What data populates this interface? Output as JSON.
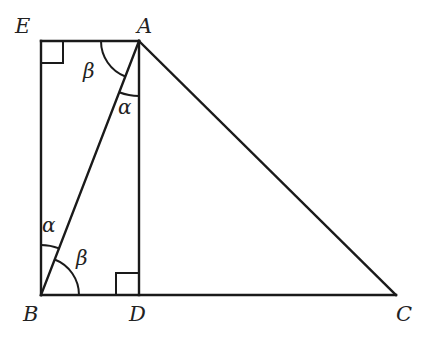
{
  "diagram": {
    "type": "geometry",
    "points": {
      "E": {
        "label": "E",
        "x": 41,
        "y": 41
      },
      "A": {
        "label": "A",
        "x": 139,
        "y": 41
      },
      "B": {
        "label": "B",
        "x": 41,
        "y": 295
      },
      "D": {
        "label": "D",
        "x": 139,
        "y": 295
      },
      "C": {
        "label": "C",
        "x": 396,
        "y": 295
      }
    },
    "segments": [
      [
        "E",
        "A"
      ],
      [
        "E",
        "B"
      ],
      [
        "B",
        "D"
      ],
      [
        "D",
        "C"
      ],
      [
        "A",
        "D"
      ],
      [
        "A",
        "B"
      ],
      [
        "A",
        "C"
      ]
    ],
    "right_angles": [
      "E",
      "D"
    ],
    "angles": {
      "beta_at_A": {
        "label": "β",
        "vertex": "A",
        "between": [
          "AE",
          "AB"
        ]
      },
      "alpha_at_A": {
        "label": "α",
        "vertex": "A",
        "between": [
          "AB",
          "AD"
        ]
      },
      "alpha_at_B": {
        "label": "α",
        "vertex": "B",
        "between": [
          "BE",
          "BA"
        ]
      },
      "beta_at_B": {
        "label": "β",
        "vertex": "B",
        "between": [
          "BA",
          "BD"
        ]
      }
    }
  }
}
